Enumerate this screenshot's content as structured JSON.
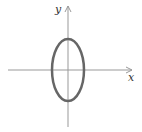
{
  "diagram": {
    "type": "ellipse-on-axes",
    "x_label": "x",
    "y_label": "y",
    "colors": {
      "axis": "#999999",
      "curve": "#666666"
    }
  }
}
